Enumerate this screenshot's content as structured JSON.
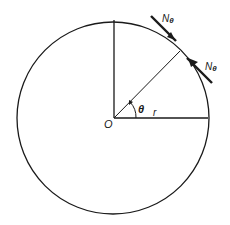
{
  "diagram": {
    "labels": {
      "center": "O",
      "radius": "r",
      "angle": "θ",
      "force_upper": "N",
      "force_upper_sub": "θ",
      "force_lower": "N",
      "force_lower_sub": "θ"
    },
    "colors": {
      "stroke": "#1a1a1a",
      "background": "#ffffff"
    }
  }
}
